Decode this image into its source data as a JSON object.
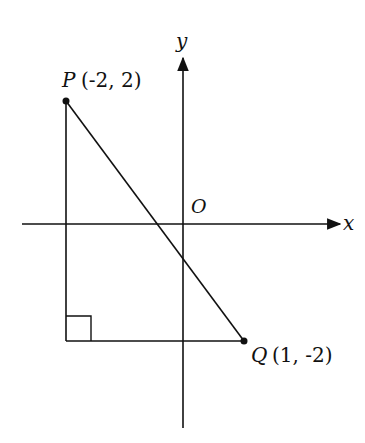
{
  "diagram": {
    "type": "coordinate-plane",
    "axes": {
      "x_label": "x",
      "y_label": "y",
      "origin_label": "O"
    },
    "points": [
      {
        "name": "P",
        "coords": "(-2, 2)",
        "label": "(-2, 2)"
      },
      {
        "name": "Q",
        "coords": "(1, -2)",
        "label": "(1, -2)"
      }
    ],
    "segments": [
      "PQ",
      "vertical from P",
      "horizontal to Q"
    ],
    "right_angle_marker": true,
    "color": "#111111"
  }
}
